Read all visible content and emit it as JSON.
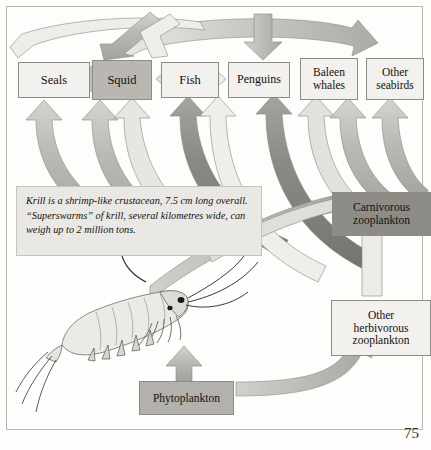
{
  "figure": {
    "page_number": "75"
  },
  "caption": {
    "text": "Krill is a shrimp-like crustacean, 7.5 cm long overall. “Superswarms” of krill, several kilometres wide, can weigh up to 2 million tons."
  },
  "nodes": {
    "seals": "Seals",
    "squid": "Squid",
    "fish": "Fish",
    "penguins": "Penguins",
    "baleen_whales_line1": "Baleen",
    "baleen_whales_line2": "whales",
    "other_seabirds_line1": "Other",
    "other_seabirds_line2": "seabirds",
    "carnivorous_zooplankton_line1": "Carnivorous",
    "carnivorous_zooplankton_line2": "zooplankton",
    "other_herbivorous_line1": "Other",
    "other_herbivorous_line2": "herbivorous",
    "other_herbivorous_line3": "zooplankton",
    "phytoplankton": "Phytoplankton"
  },
  "illustration": {
    "krill_label": "krill-illustration"
  },
  "colors": {
    "box_light": "#f2f1ee",
    "box_mid": "#b9b7b2",
    "box_dark": "#8e8c87",
    "arrow_light": "#dedcd7",
    "arrow_mid": "#b5b3ae",
    "arrow_dark": "#8a8883",
    "border": "#8d8b86",
    "text": "#14110f",
    "page_bg": "#fdfdfc"
  }
}
